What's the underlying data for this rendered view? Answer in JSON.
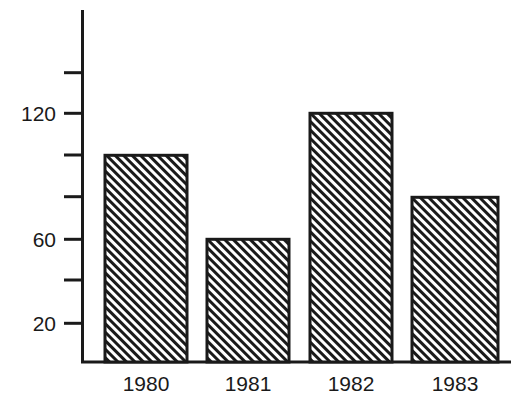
{
  "chart_data": {
    "type": "bar",
    "title": "",
    "subtitle": "",
    "xlabel": "",
    "ylabel": "",
    "categories": [
      "1980",
      "1981",
      "1982",
      "1983"
    ],
    "values": [
      100,
      60,
      120,
      80
    ],
    "series": [
      {
        "name": "",
        "values": [
          100,
          60,
          120,
          80
        ]
      }
    ],
    "ylim": [
      2,
      148
    ],
    "y_ticks": [
      20,
      40,
      60,
      80,
      100,
      120,
      140
    ],
    "y_tick_labels": [
      "20",
      "",
      "60",
      "",
      "",
      "120",
      ""
    ],
    "labeled_y_ticks": [
      {
        "value": 20,
        "label": "20"
      },
      {
        "value": 60,
        "label": "60"
      },
      {
        "value": 120,
        "label": "120"
      }
    ],
    "grid": false,
    "legend": null,
    "legend_position": "none",
    "annotations": [],
    "bar_fill": "diagonal-hatch",
    "bar_fill_color": "#1a1a1a",
    "bar_background_color": "#ffffff",
    "bar_outline_color": "#1a1a1a",
    "axis_color": "#1a1a1a",
    "plot_background": "#ffffff"
  },
  "axes": {
    "y_axis_name": "y-axis",
    "x_axis_name": "x-axis"
  },
  "bars": [
    {
      "category": "1980",
      "value": 100
    },
    {
      "category": "1981",
      "value": 60
    },
    {
      "category": "1982",
      "value": 120
    },
    {
      "category": "1983",
      "value": 80
    }
  ]
}
